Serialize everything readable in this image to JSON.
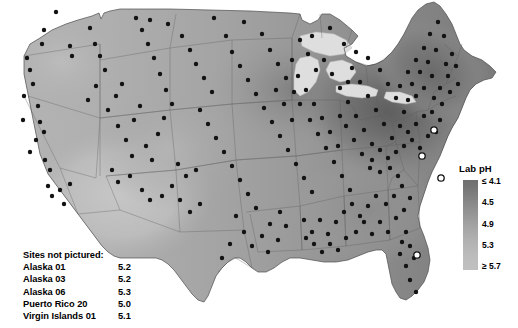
{
  "map": {
    "title": "",
    "description": "Grayscale contour map of the contiguous United States showing laboratory pH of precipitation, with monitoring site locations marked as dots.",
    "background_color": "#ffffff",
    "land_light_color": "#c4c4c4",
    "land_dark_color": "#6a6a6a",
    "lake_color": "#dcdcdc",
    "border_color": "#5a5a5a",
    "site_marker_color": "#111111",
    "open_marker_label": "open-circle-site"
  },
  "legend": {
    "title": "Lab pH",
    "ticks": [
      {
        "label": "≤ 4.1",
        "pos": 0
      },
      {
        "label": "4.5",
        "pos": 25
      },
      {
        "label": "4.9",
        "pos": 50
      },
      {
        "label": "5.3",
        "pos": 75
      },
      {
        "label": "≥ 5.7",
        "pos": 100
      }
    ],
    "gradient_top_color": "#6f6f6f",
    "gradient_bottom_color": "#c0c0c0"
  },
  "sites_not_pictured": {
    "title": "Sites not pictured:",
    "rows": [
      {
        "name": "Alaska 01",
        "value": "5.2"
      },
      {
        "name": "Alaska 03",
        "value": "5.2"
      },
      {
        "name": "Alaska 06",
        "value": "5.3"
      },
      {
        "name": "Puerto Rico 20",
        "value": "5.0"
      },
      {
        "name": "Virgin Islands 01",
        "value": "5.1"
      }
    ]
  },
  "chart_data": {
    "type": "heatmap",
    "title": "Lab pH",
    "subtitle": "",
    "xlabel": "",
    "ylabel": "",
    "colorbar_label": "Lab pH",
    "colorbar_ticks": [
      "≤ 4.1",
      "4.5",
      "4.9",
      "5.3",
      "≥ 5.7"
    ],
    "colorbar_range": [
      4.1,
      5.7
    ],
    "colorbar_orientation": "vertical",
    "colormap": "grayscale_dark_to_light",
    "grid": false,
    "legend_position": "right",
    "annotations": [
      "Sites not pictured:",
      "Alaska 01  5.2",
      "Alaska 03  5.2",
      "Alaska 06  5.3",
      "Puerto Rico 20  5.0",
      "Virgin Islands 01  5.1"
    ],
    "offmap_sites": [
      {
        "site": "Alaska 01",
        "lab_ph": 5.2
      },
      {
        "site": "Alaska 03",
        "lab_ph": 5.2
      },
      {
        "site": "Alaska 06",
        "lab_ph": 5.3
      },
      {
        "site": "Puerto Rico 20",
        "lab_ph": 5.0
      },
      {
        "site": "Virgin Islands 01",
        "lab_ph": 5.1
      }
    ],
    "region_values": [
      {
        "region": "Ohio Valley / W. Pennsylvania",
        "lab_ph": 4.2
      },
      {
        "region": "Northeast / New York",
        "lab_ph": 4.4
      },
      {
        "region": "Upper Midwest",
        "lab_ph": 4.7
      },
      {
        "region": "Southeast",
        "lab_ph": 4.8
      },
      {
        "region": "Great Plains",
        "lab_ph": 5.2
      },
      {
        "region": "Intermountain West",
        "lab_ph": 5.3
      },
      {
        "region": "Pacific Northwest",
        "lab_ph": 5.4
      },
      {
        "region": "Southwest / Desert",
        "lab_ph": 5.5
      }
    ]
  }
}
